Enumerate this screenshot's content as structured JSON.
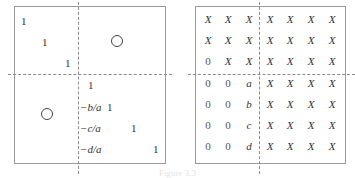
{
  "left_matrix": {
    "top_left_diagonal": [
      "1",
      "1",
      "1"
    ],
    "top_right_block": "zero-circle",
    "bottom_left_block": "zero-circle",
    "bottom_right": {
      "diagonal": [
        "1",
        "1",
        "1",
        "1"
      ],
      "column_entries": [
        "",
        "−b/a",
        "−c/a",
        "−d/a"
      ]
    }
  },
  "right_matrix": {
    "rows": [
      [
        "X",
        "X",
        "X",
        "X",
        "X",
        "X",
        "X"
      ],
      [
        "X",
        "X",
        "X",
        "X",
        "X",
        "X",
        "X"
      ],
      [
        "0",
        "X",
        "X",
        "X",
        "X",
        "X",
        "X"
      ],
      [
        "0",
        "0",
        "a",
        "X",
        "X",
        "X",
        "X"
      ],
      [
        "0",
        "0",
        "b",
        "X",
        "X",
        "X",
        "X"
      ],
      [
        "0",
        "0",
        "c",
        "X",
        "X",
        "X",
        "X"
      ],
      [
        "0",
        "0",
        "d",
        "X",
        "X",
        "X",
        "X"
      ]
    ]
  },
  "caption": "Figure 3.3"
}
